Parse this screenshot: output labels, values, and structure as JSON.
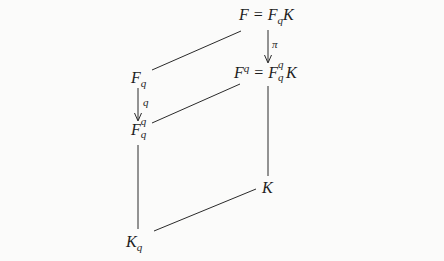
{
  "diagram": {
    "type": "field-extension-lattice",
    "nodes": {
      "top": {
        "base": "F",
        "eq": "=",
        "rhs_base": "F",
        "rhs_sub": "q",
        "rhs_tail": "K"
      },
      "mid_right": {
        "base": "F",
        "sup": "q",
        "eq": "=",
        "rhs_base": "F",
        "rhs_sup": "q",
        "rhs_sub": "q",
        "rhs_tail": "K"
      },
      "left_top": {
        "base": "F",
        "sub": "q"
      },
      "left_mid": {
        "base": "F",
        "sup": "q",
        "sub": "q"
      },
      "bottom_left": {
        "base": "K",
        "sub": "q"
      },
      "right_bottom": {
        "base": "K"
      }
    },
    "arrows": [
      {
        "from": "top",
        "to": "mid_right",
        "label": "π"
      },
      {
        "from": "left_top",
        "to": "left_mid",
        "label": "q"
      }
    ],
    "lines": [
      {
        "from": "left_top",
        "to": "top"
      },
      {
        "from": "left_mid",
        "to": "mid_right"
      },
      {
        "from": "left_mid",
        "to": "bottom_left"
      },
      {
        "from": "mid_right",
        "to": "right_bottom"
      },
      {
        "from": "bottom_left",
        "to": "right_bottom"
      }
    ]
  },
  "colors": {
    "ink": "#1e1e1e",
    "paper": "#fbfbfa"
  }
}
